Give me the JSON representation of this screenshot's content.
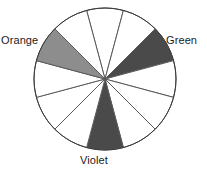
{
  "figure": {
    "type": "color-wheel-diagram",
    "title": "",
    "background_color": "#ffffff"
  },
  "wheel": {
    "center_x": 105,
    "center_y": 79,
    "radius": 71,
    "segment_count": 12,
    "segment_angle_degrees": 30,
    "outline_color": "#5a5a5a",
    "outline_width": 1,
    "fill_white": "#ffffff",
    "fill_medium_gray": "#8d8d8d",
    "fill_dark_gray": "#4a4a4a",
    "segments": [
      {
        "index": 0,
        "start_angle": -105,
        "end_angle": -75,
        "fill": "#ffffff",
        "name": "segment-1",
        "shaded": "none"
      },
      {
        "index": 1,
        "start_angle": -75,
        "end_angle": -45,
        "fill": "#ffffff",
        "name": "segment-2",
        "shaded": "none"
      },
      {
        "index": 2,
        "start_angle": -45,
        "end_angle": -15,
        "fill": "#4a4a4a",
        "name": "segment-green",
        "shaded": "dark"
      },
      {
        "index": 3,
        "start_angle": -15,
        "end_angle": 15,
        "fill": "#ffffff",
        "name": "segment-4",
        "shaded": "none"
      },
      {
        "index": 4,
        "start_angle": 15,
        "end_angle": 45,
        "fill": "#ffffff",
        "name": "segment-5",
        "shaded": "none"
      },
      {
        "index": 5,
        "start_angle": 45,
        "end_angle": 75,
        "fill": "#ffffff",
        "name": "segment-6",
        "shaded": "none"
      },
      {
        "index": 6,
        "start_angle": 75,
        "end_angle": 105,
        "fill": "#4a4a4a",
        "name": "segment-violet",
        "shaded": "dark"
      },
      {
        "index": 7,
        "start_angle": 105,
        "end_angle": 135,
        "fill": "#ffffff",
        "name": "segment-8",
        "shaded": "none"
      },
      {
        "index": 8,
        "start_angle": 135,
        "end_angle": 165,
        "fill": "#ffffff",
        "name": "segment-9",
        "shaded": "none"
      },
      {
        "index": 9,
        "start_angle": 165,
        "end_angle": 195,
        "fill": "#ffffff",
        "name": "segment-10",
        "shaded": "none"
      },
      {
        "index": 10,
        "start_angle": 195,
        "end_angle": 225,
        "fill": "#8d8d8d",
        "name": "segment-orange",
        "shaded": "medium"
      },
      {
        "index": 11,
        "start_angle": 225,
        "end_angle": 255,
        "fill": "#ffffff",
        "name": "segment-12",
        "shaded": "none"
      }
    ]
  },
  "labels": {
    "orange": "Orange",
    "green": "Green",
    "violet": "Violet"
  }
}
